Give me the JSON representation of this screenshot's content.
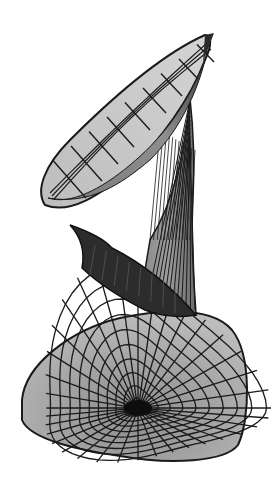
{
  "figure": {
    "colors": {
      "background": "#ffffff",
      "mesh_line": "#1a1a1a",
      "light_face": "#c8c8c8",
      "mid_face": "#9a9a9a",
      "dark_face": "#3a3a3a",
      "shadow_face": "#262626"
    },
    "upper_cup": {
      "cx": 125,
      "cy": 125,
      "rx": 100,
      "ry": 38,
      "rotate": -50,
      "rings": 4,
      "spokes": 16
    },
    "throat": {
      "tip_x": 190,
      "tip_y": 98,
      "base_left_x": 150,
      "base_right_x": 196,
      "base_y": 315
    },
    "flap": {
      "tip_x": 70,
      "tip_y": 225
    },
    "lower_bowl": {
      "cx": 135,
      "cy": 380,
      "center_x": 138,
      "center_y": 408,
      "rings": 10,
      "spokes": 36
    }
  }
}
